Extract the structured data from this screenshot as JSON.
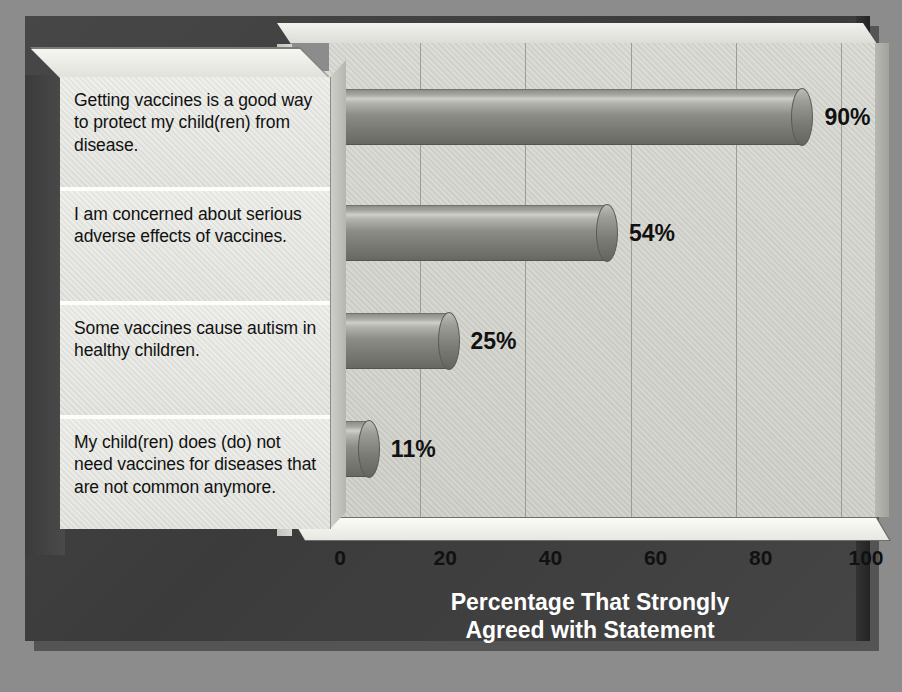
{
  "chart_data": {
    "type": "bar",
    "orientation": "horizontal",
    "title": "",
    "xlabel": "Percentage That Strongly Agreed with Statement",
    "ylabel": "Perspective",
    "xlim": [
      0,
      100
    ],
    "ylim": null,
    "grid": true,
    "legend": null,
    "style": "3d-cylinder-bars",
    "categories": [
      "Getting vaccines is a good way to protect my child(ren) from disease.",
      "I am concerned about serious adverse effects of vaccines.",
      "Some vaccines cause autism in healthy children.",
      "My child(ren) does (do) not need vaccines for diseases that are not common anymore."
    ],
    "values": [
      90,
      54,
      25,
      11
    ],
    "value_labels": [
      "90%",
      "54%",
      "25%",
      "11%"
    ],
    "xticks": [
      0,
      20,
      40,
      60,
      80,
      100
    ],
    "xtick_labels": [
      "0",
      "20",
      "40",
      "60",
      "80",
      "100"
    ]
  },
  "axes": {
    "y_title": "Perspective",
    "x_title_line1": "Percentage That Strongly",
    "x_title_line2": "Agreed with Statement"
  },
  "colors": {
    "background": "#8c8c8c",
    "frame": "#3e3e3e",
    "plot_wall": "#d4d4ce",
    "bar": "#8a8a84",
    "label_panel": "#e5e5e0",
    "text": "#111111",
    "title_text": "#ffffff"
  }
}
